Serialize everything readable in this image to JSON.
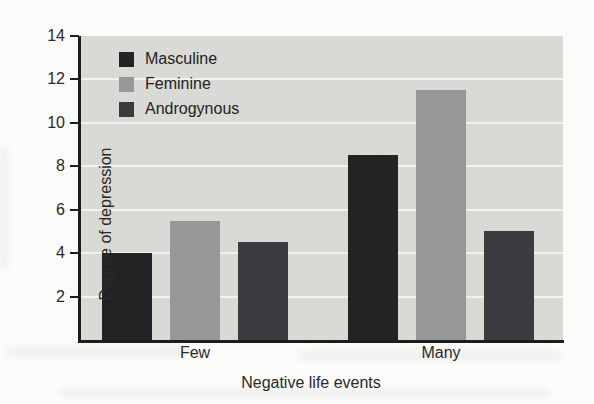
{
  "chart_data": {
    "type": "bar",
    "title": "",
    "xlabel": "Negative life events",
    "ylabel": "Degree of depression",
    "categories": [
      "Few",
      "Many"
    ],
    "series": [
      {
        "name": "Masculine",
        "color": "#232326",
        "values": [
          4.0,
          8.5
        ]
      },
      {
        "name": "Feminine",
        "color": "#97979a",
        "values": [
          5.5,
          11.5
        ]
      },
      {
        "name": "Androgynous",
        "color": "#3b3b40",
        "values": [
          4.5,
          5.0
        ]
      }
    ],
    "ylim": [
      0,
      14
    ],
    "yticks": [
      2,
      4,
      6,
      8,
      10,
      12,
      14
    ],
    "grid": true,
    "gridline_color": "#f2f2ef",
    "plot_background": "#d8d8d5",
    "axis_color": "#1d1d1b",
    "legend_position": "upper-left-inside"
  }
}
